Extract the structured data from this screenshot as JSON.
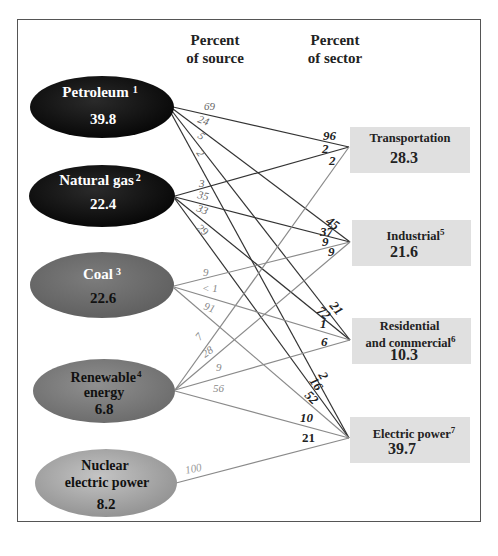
{
  "headers": {
    "percent_of_source": [
      "Percent",
      "of source"
    ],
    "percent_of_sector": [
      "Percent",
      "of sector"
    ]
  },
  "sources": [
    {
      "id": "petroleum",
      "label": "Petroleum",
      "note": "1",
      "value": "39.8",
      "fill": "#0d0d0d",
      "text_color": "#ffffff",
      "value_color": "#ffffff"
    },
    {
      "id": "natural_gas",
      "label": "Natural gas",
      "note": "2",
      "value": "22.4",
      "fill": "#141414",
      "text_color": "#ffffff",
      "value_color": "#ffffff"
    },
    {
      "id": "coal",
      "label": "Coal",
      "note": "3",
      "value": "22.6",
      "fill": "#6e6e6e",
      "text_color": "#ffffff",
      "value_color": "#111111"
    },
    {
      "id": "renewable",
      "label": "Renewable energy",
      "note": "4",
      "value": "6.8",
      "fill": "#808080",
      "text_color": "#111111",
      "value_color": "#111111"
    },
    {
      "id": "nuclear",
      "label": "Nuclear electric power",
      "note": "",
      "value": "8.2",
      "fill": "#a8a8a8",
      "text_color": "#111111",
      "value_color": "#111111"
    }
  ],
  "sectors": [
    {
      "id": "transportation",
      "label": "Transportation",
      "note": "",
      "value": "28.3"
    },
    {
      "id": "industrial",
      "label": "Industrial",
      "note": "5",
      "value": "21.6"
    },
    {
      "id": "residential_commercial",
      "label": "Residential and commercial",
      "note": "6",
      "value": "10.3"
    },
    {
      "id": "electric_power",
      "label": "Electric power",
      "note": "7",
      "value": "39.7"
    }
  ],
  "flows": [
    {
      "source": "petroleum",
      "sector": "transportation",
      "pct_of_source": "69",
      "pct_of_sector": "96"
    },
    {
      "source": "petroleum",
      "sector": "industrial",
      "pct_of_source": "24",
      "pct_of_sector": "45"
    },
    {
      "source": "petroleum",
      "sector": "residential_commercial",
      "pct_of_source": "5",
      "pct_of_sector": "21"
    },
    {
      "source": "petroleum",
      "sector": "electric_power",
      "pct_of_source": "2",
      "pct_of_sector": "2"
    },
    {
      "source": "natural_gas",
      "sector": "transportation",
      "pct_of_source": "3",
      "pct_of_sector": "2"
    },
    {
      "source": "natural_gas",
      "sector": "industrial",
      "pct_of_source": "35",
      "pct_of_sector": "37"
    },
    {
      "source": "natural_gas",
      "sector": "residential_commercial",
      "pct_of_source": "33",
      "pct_of_sector": "72"
    },
    {
      "source": "natural_gas",
      "sector": "electric_power",
      "pct_of_source": "29",
      "pct_of_sector": "16"
    },
    {
      "source": "coal",
      "sector": "industrial",
      "pct_of_source": "9",
      "pct_of_sector": "9"
    },
    {
      "source": "coal",
      "sector": "residential_commercial",
      "pct_of_source": "< 1",
      "pct_of_sector": "1"
    },
    {
      "source": "coal",
      "sector": "electric_power",
      "pct_of_source": "91",
      "pct_of_sector": "52"
    },
    {
      "source": "renewable",
      "sector": "transportation",
      "pct_of_source": "7",
      "pct_of_sector": "2"
    },
    {
      "source": "renewable",
      "sector": "industrial",
      "pct_of_source": "28",
      "pct_of_sector": "9"
    },
    {
      "source": "renewable",
      "sector": "residential_commercial",
      "pct_of_source": "9",
      "pct_of_sector": "6"
    },
    {
      "source": "renewable",
      "sector": "electric_power",
      "pct_of_source": "56",
      "pct_of_sector": "10"
    },
    {
      "source": "nuclear",
      "sector": "electric_power",
      "pct_of_source": "100",
      "pct_of_sector": "21"
    }
  ],
  "colors": {
    "frame": "#555555",
    "line_dark": "#333333",
    "line_gray": "#8a8a8a",
    "sector_box": "#e0e0e0"
  }
}
